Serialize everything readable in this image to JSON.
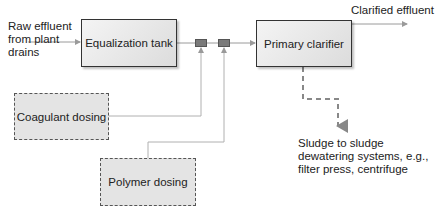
{
  "diagram": {
    "type": "process-flow",
    "title": "",
    "nodes": {
      "raw_effluent": {
        "label": "Raw effluent\nfrom plant\ndrains"
      },
      "equalization_tank": {
        "label": "Equalization tank"
      },
      "mixer_1": {
        "label": ""
      },
      "mixer_2": {
        "label": ""
      },
      "primary_clarifier": {
        "label": "Primary clarifier"
      },
      "clarified_effluent": {
        "label": "Clarified effluent"
      },
      "coagulant_dosing": {
        "label": "Coagulant dosing"
      },
      "polymer_dosing": {
        "label": "Polymer dosing"
      },
      "sludge_output": {
        "label": "Sludge to sludge\ndewatering systems, e.g.,\nfilter press, centrifuge"
      }
    },
    "edges": [
      {
        "from": "raw_effluent",
        "to": "equalization_tank",
        "style": "solid-arrow"
      },
      {
        "from": "equalization_tank",
        "to": "mixer_1",
        "style": "solid"
      },
      {
        "from": "mixer_1",
        "to": "mixer_2",
        "style": "solid"
      },
      {
        "from": "mixer_2",
        "to": "primary_clarifier",
        "style": "solid-arrow"
      },
      {
        "from": "coagulant_dosing",
        "to": "mixer_1",
        "style": "solid-arrow"
      },
      {
        "from": "polymer_dosing",
        "to": "mixer_2",
        "style": "solid-arrow"
      },
      {
        "from": "primary_clarifier",
        "to": "clarified_effluent",
        "style": "solid-arrow"
      },
      {
        "from": "primary_clarifier",
        "to": "sludge_output",
        "style": "dashed-arrow"
      }
    ],
    "colors": {
      "line": "#9a9a9a",
      "box_border": "#333333",
      "dashed_border": "#555555",
      "mixer": "#7a7a7a",
      "box_fill": "#e4e4e4"
    }
  }
}
